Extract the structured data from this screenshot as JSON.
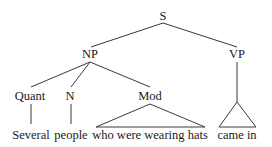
{
  "diagram": {
    "type": "syntax-tree",
    "root": "S",
    "nodes": {
      "s": "S",
      "np": "NP",
      "vp": "VP",
      "quant": "Quant",
      "n": "N",
      "mod": "Mod"
    },
    "leaves": {
      "quant": "Several",
      "n": "people",
      "mod": "who were wearing hats",
      "vp": "came in"
    },
    "edges": [
      [
        "S",
        "NP"
      ],
      [
        "S",
        "VP"
      ],
      [
        "NP",
        "Quant"
      ],
      [
        "NP",
        "N"
      ],
      [
        "NP",
        "Mod"
      ],
      [
        "Quant",
        "Several"
      ],
      [
        "N",
        "people"
      ],
      [
        "Mod",
        "who were wearing hats (triangle)"
      ],
      [
        "VP",
        "came in (triangle)"
      ]
    ]
  }
}
